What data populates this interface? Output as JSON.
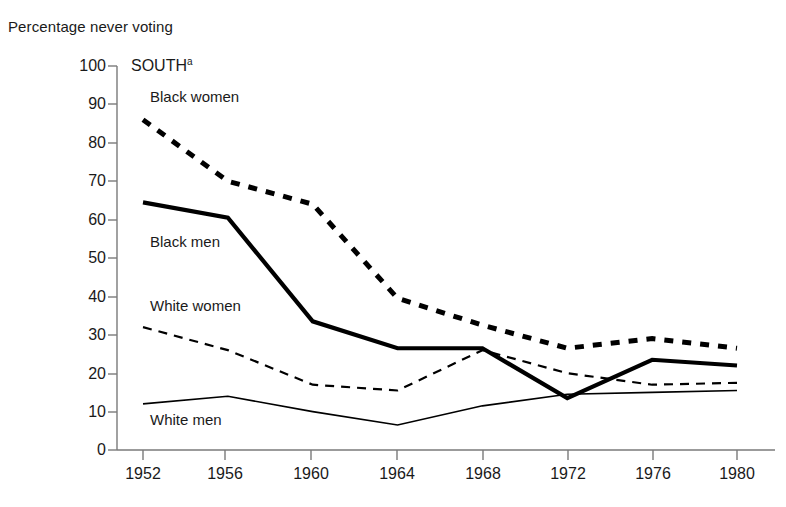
{
  "axis_title": "Percentage never voting",
  "panel_label": "SOUTH",
  "panel_label_superscript": "a",
  "chart_data": {
    "type": "line",
    "title": "SOUTH",
    "xlabel": "",
    "ylabel": "Percentage never voting",
    "x": [
      1952,
      1956,
      1960,
      1964,
      1968,
      1972,
      1976,
      1980
    ],
    "categories": [
      "1952",
      "1956",
      "1960",
      "1964",
      "1968",
      "1972",
      "1976",
      "1980"
    ],
    "ylim": [
      0,
      100
    ],
    "xlim": [
      1952,
      1980
    ],
    "yticks": [
      0,
      10,
      20,
      30,
      40,
      50,
      60,
      70,
      80,
      90,
      100
    ],
    "ytick_labels": [
      "0",
      "10",
      "20",
      "30",
      "40",
      "50",
      "60",
      "70",
      "80",
      "90",
      "100"
    ],
    "xtick_labels": [
      "1952",
      "1956",
      "1960",
      "1964",
      "1968",
      "1972",
      "1976",
      "1980"
    ],
    "grid": false,
    "legend_position": "inline-annotations",
    "series": [
      {
        "name": "Black women",
        "style": "thick-dashed",
        "color": "#000000",
        "values": [
          86,
          70,
          64,
          39.5,
          32.5,
          26.5,
          29,
          26.5
        ]
      },
      {
        "name": "Black men",
        "style": "thick-solid",
        "color": "#000000",
        "values": [
          64.5,
          60.5,
          33.5,
          26.5,
          26.5,
          13.5,
          23.5,
          22
        ]
      },
      {
        "name": "White women",
        "style": "thin-dashed",
        "color": "#000000",
        "values": [
          32,
          26,
          17,
          15.5,
          26,
          20,
          17,
          17.5
        ]
      },
      {
        "name": "White men",
        "style": "thin-solid",
        "color": "#000000",
        "values": [
          12,
          14,
          10,
          6.5,
          11.5,
          14.5,
          15,
          15.5
        ]
      }
    ],
    "annotations": [
      {
        "text": "Black women",
        "x": 1953.3,
        "y": 91
      },
      {
        "text": "Black men",
        "x": 1953.3,
        "y": 53
      },
      {
        "text": "White women",
        "x": 1953.3,
        "y": 36.5
      },
      {
        "text": "White men",
        "x": 1953.3,
        "y": 6.5
      }
    ]
  },
  "colors": {
    "ink": "#1a1a1a",
    "axis": "#7a7a7a",
    "series": "#000000",
    "background": "#ffffff"
  }
}
